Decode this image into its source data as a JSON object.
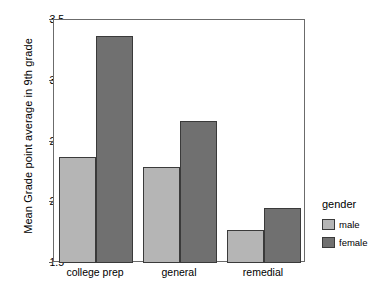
{
  "chart_data": {
    "type": "bar",
    "title": "",
    "xlabel": "",
    "ylabel": "Mean Grade point average in 9th grade",
    "categories": [
      "college prep",
      "general",
      "remedial"
    ],
    "series": [
      {
        "name": "male",
        "values": [
          2.37,
          2.29,
          1.77
        ],
        "color": "#b5b5b5"
      },
      {
        "name": "female",
        "values": [
          3.37,
          2.67,
          1.95
        ],
        "color": "#707070"
      }
    ],
    "ylim": [
      1.5,
      3.5
    ],
    "yticks": [
      "1.5",
      "2.0",
      "2.5",
      "3.0",
      "3.5"
    ],
    "ytick_values": [
      1.5,
      2.0,
      2.5,
      3.0,
      3.5
    ],
    "grid": false,
    "legend": {
      "title": "gender",
      "position": "right",
      "entries": [
        {
          "label": "male",
          "color": "#b5b5b5"
        },
        {
          "label": "female",
          "color": "#707070"
        }
      ]
    }
  }
}
